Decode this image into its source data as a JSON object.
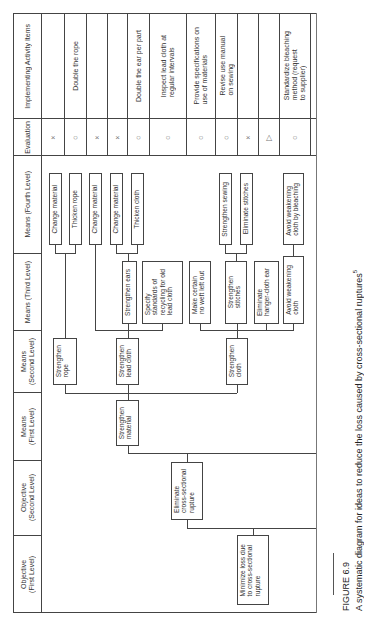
{
  "figure": {
    "number": "FIGURE 6.9",
    "caption": "A systematic diagram for ideas to reduce the loss caused by cross-sectional ruptures",
    "caption_superscript": "5",
    "orientation": "rotated 90° counter-clockwise"
  },
  "columns": [
    {
      "id": "objective_1",
      "label": "Objective\n(First Level)"
    },
    {
      "id": "objective_2",
      "label": "Objective\n(Second Level)"
    },
    {
      "id": "means_1",
      "label": "Means\n(First Level)"
    },
    {
      "id": "means_2",
      "label": "Means\n(Second Level)"
    },
    {
      "id": "means_3",
      "label": "Means (Third Level)"
    },
    {
      "id": "means_4",
      "label": "Means (Fourth Level)"
    },
    {
      "id": "evaluation",
      "label": "Evaluation"
    },
    {
      "id": "activity",
      "label": "Implementing Activity Items"
    }
  ],
  "tree": {
    "objective_1": "Minimize loss due\nto cross-sectional\nrupture",
    "objective_2": "Eliminate\ncross-sectional\nrupture",
    "means_1": "Strengthen\nmaterial",
    "means_2": [
      "Strengthen\nrope",
      "Strengthen\nlead cloth",
      "Strengthen\ncloth"
    ],
    "means_3": [
      "Strengthen ears",
      "Specify\nstandards of\nrecycling for old\nlead cloth",
      "Make certain\nno weft left out",
      "Strengthen\nstitches",
      "Eliminate\nhanger-cloth ear",
      "Avoid weakening\ncloth"
    ],
    "means_4": [
      "Change material",
      "Thicken rope",
      "Change material",
      "Change material",
      "Thicken cloth",
      "Strengthen sewing",
      "Eliminate stitches",
      "Avoid weakening\ncloth by bleaching"
    ]
  },
  "rows": [
    {
      "evaluation": "×",
      "activity": ""
    },
    {
      "evaluation": "○",
      "activity": "Double the rope"
    },
    {
      "evaluation": "×",
      "activity": ""
    },
    {
      "evaluation": "×",
      "activity": ""
    },
    {
      "evaluation": "○",
      "activity": "Double the ear per part"
    },
    {
      "evaluation": "○",
      "activity": "Inspect lead cloth at\nregular intervals"
    },
    {
      "evaluation": "○",
      "activity": "Provide specifications on\nuse of materials"
    },
    {
      "evaluation": "○",
      "activity": "Revise use manual\non sewing"
    },
    {
      "evaluation": "×",
      "activity": ""
    },
    {
      "evaluation": "△",
      "activity": ""
    },
    {
      "evaluation": "○",
      "activity": "Standardize bleaching\nmethod (request\nto supplier)"
    }
  ]
}
